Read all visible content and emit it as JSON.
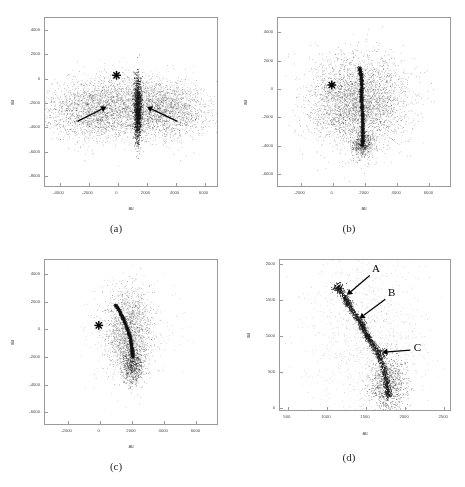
{
  "figure": {
    "background": "#ffffff",
    "axis_color": "#9a9a9a",
    "point_color": "#1a1a1a",
    "annotation_color": "#000000"
  },
  "panels": [
    {
      "id": "a",
      "caption": "(a)",
      "xlabel": "au",
      "ylabel": "au",
      "xticks": [
        -4000,
        -2000,
        0,
        2000,
        4000,
        6000
      ],
      "yticks": [
        4000,
        2000,
        0,
        -2000,
        -4000,
        -6000,
        -8000
      ],
      "xlim": [
        -5000,
        7000
      ],
      "ylim": [
        -9000,
        5000
      ],
      "star_marker": {
        "x": 0,
        "y": 200,
        "label": "star-marker"
      },
      "arrows": [
        {
          "name": "arrow-left",
          "x1": -2700,
          "y1": -3600,
          "x2": -700,
          "y2": -2400,
          "label": ""
        },
        {
          "name": "arrow-right",
          "x1": 4200,
          "y1": -3600,
          "x2": 2100,
          "y2": -2400,
          "label": ""
        }
      ],
      "letters": []
    },
    {
      "id": "b",
      "caption": "(b)",
      "xlabel": "au",
      "ylabel": "au",
      "xticks": [
        -2000,
        0,
        2000,
        4000,
        6000
      ],
      "yticks": [
        4000,
        2000,
        0,
        -2000,
        -4000,
        -6000
      ],
      "xlim": [
        -3400,
        7400
      ],
      "ylim": [
        -7000,
        5000
      ],
      "star_marker": {
        "x": 0,
        "y": 200,
        "label": "star-marker"
      },
      "arrows": [],
      "letters": []
    },
    {
      "id": "c",
      "caption": "(c)",
      "xlabel": "au",
      "ylabel": "au",
      "xticks": [
        -2000,
        0,
        2000,
        4000,
        6000
      ],
      "yticks": [
        4000,
        2000,
        0,
        -2000,
        -4000,
        -6000
      ],
      "xlim": [
        -3400,
        7400
      ],
      "ylim": [
        -7000,
        5000
      ],
      "star_marker": {
        "x": 0,
        "y": 200,
        "label": "star-marker"
      },
      "arrows": [],
      "letters": []
    },
    {
      "id": "d",
      "caption": "(d)",
      "xlabel": "au",
      "ylabel": "au",
      "xticks": [
        500,
        1000,
        1500,
        2000,
        2500
      ],
      "yticks": [
        0,
        500,
        1000,
        1500,
        2000
      ],
      "xlim": [
        400,
        2600
      ],
      "ylim": [
        -60,
        2060
      ],
      "star_marker": null,
      "arrows": [
        {
          "name": "arrow-a",
          "x1": 1560,
          "y1": 1830,
          "x2": 1270,
          "y2": 1560,
          "label": "A"
        },
        {
          "name": "arrow-b",
          "x1": 1760,
          "y1": 1500,
          "x2": 1430,
          "y2": 1230,
          "label": "B"
        },
        {
          "name": "arrow-c",
          "x1": 2080,
          "y1": 790,
          "x2": 1720,
          "y2": 760,
          "label": "C"
        }
      ],
      "letters": [
        {
          "text": "A",
          "x": 1640,
          "y": 1930
        },
        {
          "text": "B",
          "x": 1840,
          "y": 1600
        },
        {
          "text": "C",
          "x": 2170,
          "y": 830
        }
      ]
    }
  ],
  "chart_data": {
    "type": "scatter",
    "title": "",
    "xlabel": "au",
    "ylabel": "au",
    "grid": false,
    "legend": "none",
    "panel_count": 4,
    "panels": [
      {
        "id": "a",
        "caption": "(a)",
        "description": "Fan-shaped bilateral debris cloud with a narrow dense vertical spine near x=1500; two arrows point inward at the spine from both sides. Star marker near origin.",
        "xlim": [
          -5000,
          7000
        ],
        "ylim": [
          -9000,
          5000
        ],
        "n_points": 6500,
        "clusters": [
          {
            "name": "left-wing",
            "cx": -1400,
            "cy": -2700,
            "sx": 1700,
            "sy": 1150,
            "n": 2200,
            "density": "diffuse"
          },
          {
            "name": "right-wing",
            "cx": 3200,
            "cy": -2700,
            "sx": 1500,
            "sy": 1100,
            "n": 2000,
            "density": "diffuse"
          },
          {
            "name": "central-spine",
            "cx": 1450,
            "cy": -2600,
            "sx": 130,
            "sy": 1300,
            "n": 1400,
            "density": "dense"
          },
          {
            "name": "upper-halo",
            "cx": 1100,
            "cy": -1100,
            "sx": 1900,
            "sy": 800,
            "n": 900,
            "density": "sparse"
          }
        ],
        "arrows": [
          {
            "label": "",
            "tail": [
              -2700,
              -3600
            ],
            "head": [
              -700,
              -2400
            ]
          },
          {
            "label": "",
            "tail": [
              4200,
              -3600
            ],
            "head": [
              2100,
              -2400
            ]
          }
        ],
        "markers": [
          {
            "type": "star",
            "x": 0,
            "y": 200
          }
        ]
      },
      {
        "id": "b",
        "caption": "(b)",
        "description": "Round diffuse halo with an S-shaped curved dense filament running vertically near x=1800 from y=+1500 down to y=-4000. Star marker near origin.",
        "xlim": [
          -3400,
          7400
        ],
        "ylim": [
          -7000,
          5000
        ],
        "n_points": 6500,
        "clusters": [
          {
            "name": "halo",
            "cx": 1600,
            "cy": -1000,
            "sx": 1500,
            "sy": 1600,
            "n": 3600,
            "density": "diffuse"
          },
          {
            "name": "curved-filament",
            "path": [
              [
                1700,
                1500
              ],
              [
                1800,
                900
              ],
              [
                1850,
                200
              ],
              [
                1800,
                -600
              ],
              [
                1870,
                -1600
              ],
              [
                1900,
                -2600
              ],
              [
                1900,
                -3600
              ],
              [
                1850,
                -4100
              ]
            ],
            "width": 110,
            "n": 2200,
            "density": "dense"
          },
          {
            "name": "tail-spray",
            "cx": 1900,
            "cy": -4000,
            "sx": 320,
            "sy": 450,
            "n": 500,
            "density": "medium"
          }
        ],
        "arrows": [],
        "markers": [
          {
            "type": "star",
            "x": 0,
            "y": 200
          }
        ]
      },
      {
        "id": "c",
        "caption": "(c)",
        "description": "Narrow crescent-shaped dense filament curving from upper-left (1000,1800) down to (2100,-2000), with a diffuse envelope. Star marker near origin.",
        "xlim": [
          -3400,
          7400
        ],
        "ylim": [
          -7000,
          5000
        ],
        "n_points": 5200,
        "clusters": [
          {
            "name": "crescent-filament",
            "path": [
              [
                1000,
                1750
              ],
              [
                1250,
                1300
              ],
              [
                1500,
                700
              ],
              [
                1750,
                0
              ],
              [
                1950,
                -800
              ],
              [
                2050,
                -1600
              ],
              [
                2080,
                -2100
              ]
            ],
            "width": 95,
            "n": 2400,
            "density": "dense"
          },
          {
            "name": "envelope",
            "cx": 1850,
            "cy": -200,
            "sx": 700,
            "sy": 1500,
            "n": 1800,
            "density": "diffuse"
          },
          {
            "name": "lower-spray",
            "cx": 2050,
            "cy": -2700,
            "sx": 330,
            "sy": 700,
            "n": 700,
            "density": "medium"
          },
          {
            "name": "outer-halo",
            "cx": 2000,
            "cy": -200,
            "sx": 1500,
            "sy": 1900,
            "n": 300,
            "density": "sparse"
          }
        ],
        "arrows": [],
        "markers": [
          {
            "type": "star",
            "x": 0,
            "y": 200
          }
        ]
      },
      {
        "id": "d",
        "caption": "(d)",
        "description": "Zoomed view of the filament showing three dense knots labeled A, B and C along a chain running from (1150,1680) to (1800,200). Arrows point at each knot.",
        "xlim": [
          400,
          2600
        ],
        "ylim": [
          -60,
          2060
        ],
        "n_points": 4200,
        "clusters": [
          {
            "name": "filament-chain",
            "path": [
              [
                1150,
                1680
              ],
              [
                1250,
                1500
              ],
              [
                1350,
                1320
              ],
              [
                1450,
                1150
              ],
              [
                1550,
                950
              ],
              [
                1650,
                780
              ],
              [
                1730,
                560
              ],
              [
                1780,
                330
              ],
              [
                1800,
                120
              ]
            ],
            "width": 42,
            "n": 1700,
            "density": "dense"
          },
          {
            "name": "knot-top",
            "cx": 1150,
            "cy": 1680,
            "sx": 35,
            "sy": 35,
            "n": 120,
            "density": "very-dense"
          },
          {
            "name": "knot-A",
            "cx": 1270,
            "cy": 1480,
            "sx": 30,
            "sy": 45,
            "n": 90,
            "density": "dense"
          },
          {
            "name": "knot-B",
            "cx": 1470,
            "cy": 1130,
            "sx": 28,
            "sy": 45,
            "n": 95,
            "density": "dense"
          },
          {
            "name": "knot-mid",
            "cx": 1530,
            "cy": 980,
            "sx": 24,
            "sy": 30,
            "n": 70,
            "density": "dense"
          },
          {
            "name": "knot-C",
            "cx": 1700,
            "cy": 760,
            "sx": 45,
            "sy": 30,
            "n": 85,
            "density": "dense"
          },
          {
            "name": "lower-spray",
            "cx": 1800,
            "cy": 300,
            "sx": 120,
            "sy": 220,
            "n": 900,
            "density": "medium"
          },
          {
            "name": "halo",
            "cx": 1500,
            "cy": 950,
            "sx": 380,
            "sy": 620,
            "n": 1100,
            "density": "sparse"
          }
        ],
        "arrows": [
          {
            "label": "A",
            "tail": [
              1560,
              1830
            ],
            "head": [
              1270,
              1560
            ]
          },
          {
            "label": "B",
            "tail": [
              1760,
              1500
            ],
            "head": [
              1430,
              1230
            ]
          },
          {
            "label": "C",
            "tail": [
              2080,
              790
            ],
            "head": [
              1720,
              760
            ]
          }
        ],
        "markers": []
      }
    ]
  }
}
